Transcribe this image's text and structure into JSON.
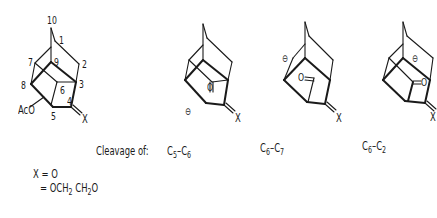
{
  "figure": {
    "structures": [
      {
        "id": "parent",
        "atom_labels": [
          "10",
          "1",
          "9",
          "7",
          "2",
          "8",
          "3",
          "6",
          "4",
          "5"
        ],
        "substituents": {
          "acetoxy": "AcO",
          "exocyclic": "X"
        }
      },
      {
        "id": "product-c5-c6",
        "anion": "⊖",
        "carbonyl": "O",
        "exocyclic": "X"
      },
      {
        "id": "product-c6-c7",
        "anion": "⊖",
        "carbonyl": "O",
        "exocyclic": "X"
      },
      {
        "id": "product-c6-c2",
        "anion": "⊖",
        "carbonyl": "O",
        "exocyclic": "X"
      }
    ],
    "captions": {
      "prefix": "Cleavage of:",
      "c5c6": {
        "a": "C",
        "a_sub": "5",
        "dash": "–",
        "b": "C",
        "b_sub": "6"
      },
      "c6c7": {
        "a": "C",
        "a_sub": "6",
        "dash": "–",
        "b": "C",
        "b_sub": "7"
      },
      "c6c2": {
        "a": "C",
        "a_sub": "6",
        "dash": "–",
        "b": "C",
        "b_sub": "2"
      }
    },
    "legend": {
      "line1": "X = O",
      "line2_prefix": "= OCH",
      "line2_sub1": "2",
      "line2_mid": " CH",
      "line2_sub2": "2",
      "line2_suffix": "O"
    }
  }
}
